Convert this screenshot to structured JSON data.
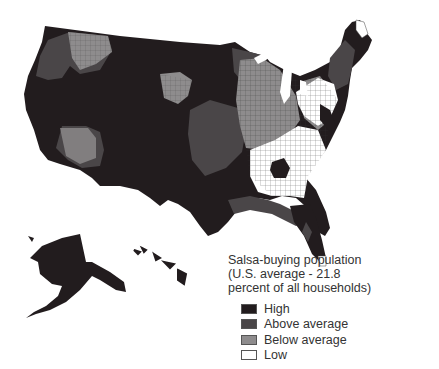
{
  "map": {
    "title": "Salsa-buying population",
    "subtitle_line1": "(U.S. average - 21.8",
    "subtitle_line2": "percent of all households)",
    "region": "United States (counties, incl. Alaska and Hawaii)",
    "colors": {
      "high": "#221c1e",
      "above_average": "#4a4648",
      "below_average": "#8e8c8d",
      "low": "#ffffff",
      "border": "#3a3a3a"
    }
  },
  "legend": {
    "items": [
      {
        "label": "High",
        "key": "high"
      },
      {
        "label": "Above average",
        "key": "above_average"
      },
      {
        "label": "Below average",
        "key": "below_average"
      },
      {
        "label": "Low",
        "key": "low"
      }
    ]
  }
}
